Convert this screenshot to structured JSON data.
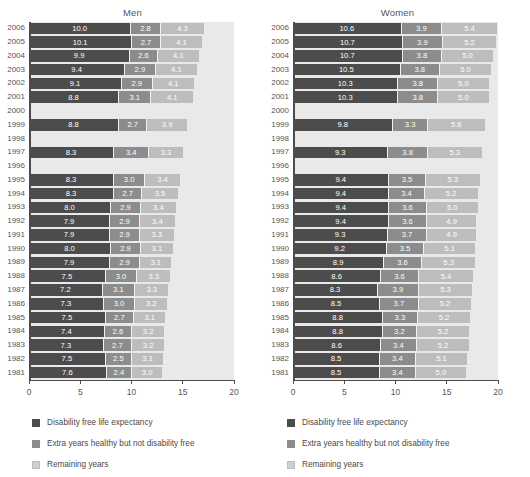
{
  "chart_data": {
    "type": "bar",
    "title": "",
    "subtype": "stacked-horizontal",
    "xlabel": "",
    "ylabel": "",
    "xlim": [
      0,
      20
    ],
    "xticks": [
      0,
      5,
      10,
      15,
      20
    ],
    "xtick_labels": [
      "0",
      "5",
      "10",
      "15",
      "20"
    ],
    "grid": false,
    "legend_position": "below",
    "series_names": [
      "Disability free life expectancy",
      "Extra years healthy but not disability free",
      "Remaining years"
    ],
    "series_colors": [
      "#4c4c4c",
      "#8c8c8c",
      "#bdbdbd"
    ],
    "panels": [
      {
        "title": "Men",
        "categories": [
          "2006",
          "2005",
          "2004",
          "2003",
          "2002",
          "2001",
          "2000",
          "1999",
          "1998",
          "1997",
          "1996",
          "1995",
          "1994",
          "1993",
          "1992",
          "1991",
          "1990",
          "1989",
          "1988",
          "1987",
          "1986",
          "1985",
          "1984",
          "1983",
          "1982",
          "1981"
        ],
        "series": [
          {
            "name": "Disability free life expectancy",
            "values": [
              10.0,
              10.1,
              9.9,
              9.4,
              9.1,
              8.8,
              null,
              8.8,
              null,
              8.3,
              null,
              8.3,
              8.3,
              8.0,
              7.9,
              7.9,
              8.0,
              7.9,
              7.5,
              7.2,
              7.3,
              7.5,
              7.4,
              7.3,
              7.5,
              7.6
            ]
          },
          {
            "name": "Extra years healthy but not disability free",
            "values": [
              2.8,
              2.7,
              2.6,
              2.9,
              2.9,
              3.1,
              null,
              2.7,
              null,
              3.4,
              null,
              3.0,
              2.7,
              2.9,
              2.9,
              2.9,
              2.9,
              2.9,
              3.0,
              3.1,
              3.0,
              2.7,
              2.6,
              2.7,
              2.5,
              2.4
            ]
          },
          {
            "name": "Remaining years",
            "values": [
              4.3,
              4.1,
              4.1,
              4.1,
              4.1,
              4.1,
              null,
              3.9,
              null,
              3.3,
              null,
              3.4,
              3.5,
              3.4,
              3.4,
              3.3,
              3.1,
              3.1,
              3.3,
              3.3,
              3.2,
              3.1,
              3.2,
              3.2,
              3.1,
              3.0
            ]
          }
        ]
      },
      {
        "title": "Women",
        "categories": [
          "2006",
          "2005",
          "2004",
          "2003",
          "2002",
          "2001",
          "2000",
          "1999",
          "1998",
          "1997",
          "1996",
          "1995",
          "1994",
          "1993",
          "1992",
          "1991",
          "1990",
          "1989",
          "1988",
          "1987",
          "1986",
          "1985",
          "1984",
          "1983",
          "1982",
          "1981"
        ],
        "series": [
          {
            "name": "Disability free life expectancy",
            "values": [
              10.6,
              10.7,
              10.7,
              10.5,
              10.3,
              10.3,
              null,
              9.8,
              null,
              9.3,
              null,
              9.4,
              9.4,
              9.4,
              9.4,
              9.3,
              9.2,
              8.9,
              8.6,
              8.3,
              8.5,
              8.8,
              8.8,
              8.6,
              8.5,
              8.5
            ]
          },
          {
            "name": "Extra years healthy but not disability free",
            "values": [
              3.9,
              3.9,
              3.8,
              3.8,
              3.8,
              3.8,
              null,
              3.3,
              null,
              3.8,
              null,
              3.5,
              3.4,
              3.6,
              3.6,
              3.7,
              3.5,
              3.6,
              3.6,
              3.9,
              3.7,
              3.3,
              3.2,
              3.4,
              3.4,
              3.4
            ]
          },
          {
            "name": "Remaining years",
            "values": [
              5.4,
              5.2,
              5.0,
              5.0,
              5.0,
              5.0,
              null,
              5.6,
              null,
              5.3,
              null,
              5.3,
              5.2,
              5.0,
              4.9,
              4.9,
              5.1,
              5.3,
              5.4,
              5.3,
              5.2,
              5.2,
              5.2,
              5.2,
              5.1,
              5.0
            ]
          }
        ]
      }
    ]
  },
  "legends": [
    {
      "items": [
        {
          "label": "Disability free life expectancy",
          "color": "#4c4c4c"
        },
        {
          "label": "Extra years healthy but not disability free",
          "color": "#8c8c8c"
        },
        {
          "label": "Remaining years",
          "color": "#cfcfcf"
        }
      ]
    },
    {
      "items": [
        {
          "label": "Disability free life expectancy",
          "color": "#4c4c4c"
        },
        {
          "label": "Extra years healthy but not disability free",
          "color": "#8c8c8c"
        },
        {
          "label": "Remaining years",
          "color": "#cfcfcf"
        }
      ]
    }
  ]
}
